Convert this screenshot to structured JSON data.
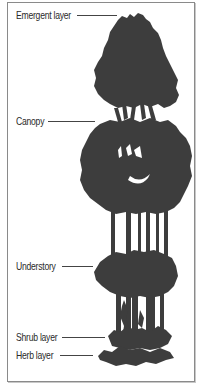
{
  "diagram": {
    "colors": {
      "silhouette": "#3d3d3d",
      "frame": "#8a8a8a",
      "text": "#2a2a2a",
      "background": "#ffffff"
    },
    "layers": [
      {
        "label": "Emergent layer",
        "y": 15
      },
      {
        "label": "Canopy",
        "y": 121
      },
      {
        "label": "Understory",
        "y": 266
      },
      {
        "label": "Shrub layer",
        "y": 337
      },
      {
        "label": "Herb layer",
        "y": 355
      }
    ]
  }
}
